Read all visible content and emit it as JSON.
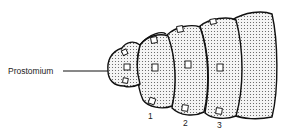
{
  "diagram": {
    "title_label": "Prostomium",
    "segment_labels": [
      "1",
      "2",
      "3"
    ],
    "colors": {
      "outline": "#111111",
      "fill": "#f2f2f2",
      "stipple": "#555555",
      "background": "#ffffff"
    }
  }
}
